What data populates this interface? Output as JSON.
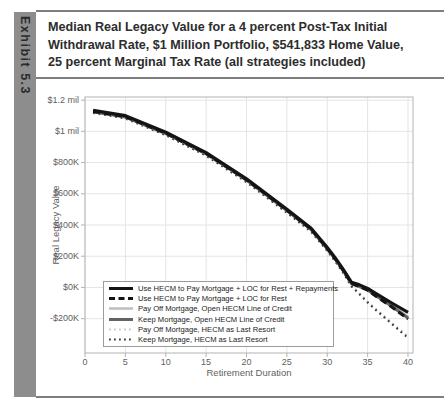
{
  "exhibit": {
    "label": "Exhibit 5.3",
    "bar_color": "#8d8d8d",
    "text_color": "#2b2b2b"
  },
  "title": {
    "lines": [
      "Median Real Legacy Value for a 4 percent Post-Tax Initial",
      "Withdrawal Rate, $1 Million Portfolio, $541,833 Home Value,",
      "25 percent Marginal Tax Rate (all strategies included)"
    ],
    "color": "#2d2d2d"
  },
  "chart_data": {
    "type": "line",
    "title": "",
    "xlabel": "Retirement Duration",
    "ylabel": "Real Legacy Value",
    "xlim": [
      0,
      40.6
    ],
    "ylim_thousands": [
      -420,
      1220
    ],
    "grid": true,
    "legend_position": "inside-bottom-left",
    "xticks": [
      0,
      5,
      10,
      15,
      20,
      25,
      30,
      35,
      40
    ],
    "yticks": [
      {
        "value_k": 1200,
        "label": "$1.2 mil"
      },
      {
        "value_k": 1000,
        "label": "$1 mil"
      },
      {
        "value_k": 800,
        "label": "$800K"
      },
      {
        "value_k": 600,
        "label": "$600K"
      },
      {
        "value_k": 400,
        "label": "$400K"
      },
      {
        "value_k": 200,
        "label": "$200K"
      },
      {
        "value_k": 0,
        "label": "$0K"
      },
      {
        "value_k": -200,
        "label": "-$200K"
      }
    ],
    "units": "thousands of real dollars",
    "x": [
      1,
      5,
      10,
      15,
      20,
      25,
      28,
      30,
      31,
      32,
      33,
      34,
      35,
      36,
      38,
      40
    ],
    "series": [
      {
        "name": "Use HECM to Pay Mortgage + LOC for Rest + Repayments",
        "line_style": "solid",
        "color": "#141414",
        "width": 3.2,
        "values_k": [
          1134,
          1100,
          994,
          864,
          696,
          501,
          379,
          255,
          189,
          114,
          32,
          16,
          -6,
          -38,
          -100,
          -159
        ]
      },
      {
        "name": "Use HECM to Pay Mortgage + LOC for Rest",
        "line_style": "dashed",
        "color": "#141414",
        "width": 3.0,
        "values_k": [
          1128,
          1094,
          988,
          858,
          690,
          495,
          373,
          249,
          183,
          108,
          26,
          6,
          -18,
          -55,
          -125,
          -203
        ]
      },
      {
        "name": "Pay Off Mortgage, Open HECM Line of Credit",
        "line_style": "solid",
        "color": "#bfbfbf",
        "width": 2.6,
        "values_k": [
          1129,
          1095,
          989,
          859,
          691,
          496,
          374,
          250,
          184,
          109,
          27,
          9,
          -13,
          -48,
          -116,
          -190
        ]
      },
      {
        "name": "Keep Mortgage, Open HECM Line of Credit",
        "line_style": "solid",
        "color": "#636363",
        "width": 3.0,
        "values_k": [
          1126,
          1092,
          986,
          856,
          688,
          493,
          371,
          247,
          181,
          106,
          24,
          6,
          -16,
          -51,
          -120,
          -196
        ]
      },
      {
        "name": "Pay Off Mortgage, HECM as Last Resort",
        "line_style": "dotted",
        "color": "#c9c9c9",
        "width": 2.2,
        "values_k": [
          1125,
          1089,
          981,
          850,
          681,
          485,
          363,
          240,
          173,
          98,
          13,
          -37,
          -90,
          -137,
          -227,
          -312
        ]
      },
      {
        "name": "Keep Mortgage, HECM as Last Resort",
        "line_style": "dotted",
        "color": "#3d3d3d",
        "width": 2.2,
        "values_k": [
          1119,
          1083,
          975,
          844,
          675,
          479,
          357,
          234,
          167,
          92,
          7,
          -43,
          -96,
          -143,
          -233,
          -324
        ]
      }
    ]
  },
  "theme": {
    "grid_color": "#e4e4e4",
    "axis_color": "#b3b3b3",
    "tick_text_color": "#5f5f5f",
    "rule_color": "#7e7e7e",
    "legend_border": "#9b9b9b",
    "legend_text": "#1c1c1c"
  }
}
